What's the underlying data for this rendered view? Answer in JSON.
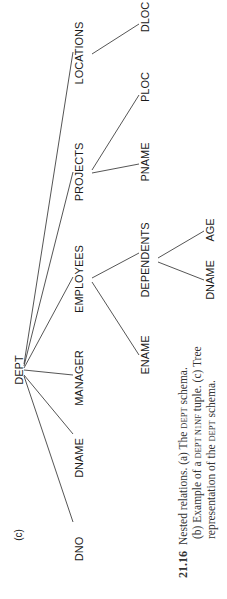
{
  "figure": {
    "panel_label": "(c)",
    "orientation": "rotated 90 degrees counter-clockwise",
    "tree": {
      "root": "DEPT",
      "level1": [
        "DNO",
        "DNAME",
        "MANAGER",
        "EMPLOYEES",
        "PROJECTS",
        "LOCATIONS"
      ],
      "employees_children": [
        "ENAME",
        "DEPENDENTS"
      ],
      "dependents_children": [
        "DNAME",
        "AGE"
      ],
      "projects_children": [
        "PNAME",
        "PLOC"
      ],
      "locations_children": [
        "DLOC"
      ]
    },
    "labels": {
      "dept": "DEPT",
      "dno": "DNO",
      "dname": "DNAME",
      "manager": "MANAGER",
      "employees": "EMPLOYEES",
      "projects": "PROJECTS",
      "locations": "LOCATIONS",
      "ename": "ENAME",
      "dependents": "DEPENDENTS",
      "dep_dname": "DNAME",
      "age": "AGE",
      "pname": "PNAME",
      "ploc": "PLOC",
      "dloc": "DLOC"
    }
  },
  "caption": {
    "number": "21.16",
    "line1_a": "Nested relations. (a) The ",
    "line1_sc": "DEPT",
    "line1_b": " schema.",
    "line2_a": "(b) Example of a ",
    "line2_sc1": "DEPT N1NF",
    "line2_b": " tuple. (c) Tree",
    "line3_a": "representation of the ",
    "line3_sc": "DEPT",
    "line3_b": " schema."
  }
}
